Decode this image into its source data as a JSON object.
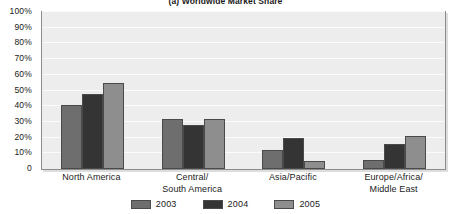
{
  "chart_data": {
    "type": "bar",
    "title": "(a) Worldwide Market Share",
    "xlabel": "",
    "ylabel": "",
    "ylim": [
      0,
      100
    ],
    "grid": true,
    "legend_position": "bottom",
    "categories": [
      "North America",
      "Central/ South America",
      "Asia/Pacific",
      "Europe/Africa/ Middle East"
    ],
    "category_lines": [
      [
        "North America"
      ],
      [
        "Central/",
        "South America"
      ],
      [
        "Asia/Pacific"
      ],
      [
        "Europe/Africa/",
        "Middle East"
      ]
    ],
    "series": [
      {
        "name": "2003",
        "color": "#6e6e6e",
        "values": [
          41,
          32,
          12,
          6
        ]
      },
      {
        "name": "2004",
        "color": "#343434",
        "values": [
          48,
          28,
          20,
          16
        ]
      },
      {
        "name": "2005",
        "color": "#8e8e8e",
        "values": [
          55,
          32,
          5,
          21
        ]
      }
    ],
    "y_ticks": [
      {
        "value": 100,
        "label": "100%"
      },
      {
        "value": 90,
        "label": "90%"
      },
      {
        "value": 80,
        "label": "80%"
      },
      {
        "value": 70,
        "label": "70%"
      },
      {
        "value": 60,
        "label": "60%"
      },
      {
        "value": 50,
        "label": "50%"
      },
      {
        "value": 40,
        "label": "40%"
      },
      {
        "value": 30,
        "label": "30%"
      },
      {
        "value": 20,
        "label": "20%"
      },
      {
        "value": 10,
        "label": "10%"
      },
      {
        "value": 0,
        "label": "0"
      }
    ]
  }
}
